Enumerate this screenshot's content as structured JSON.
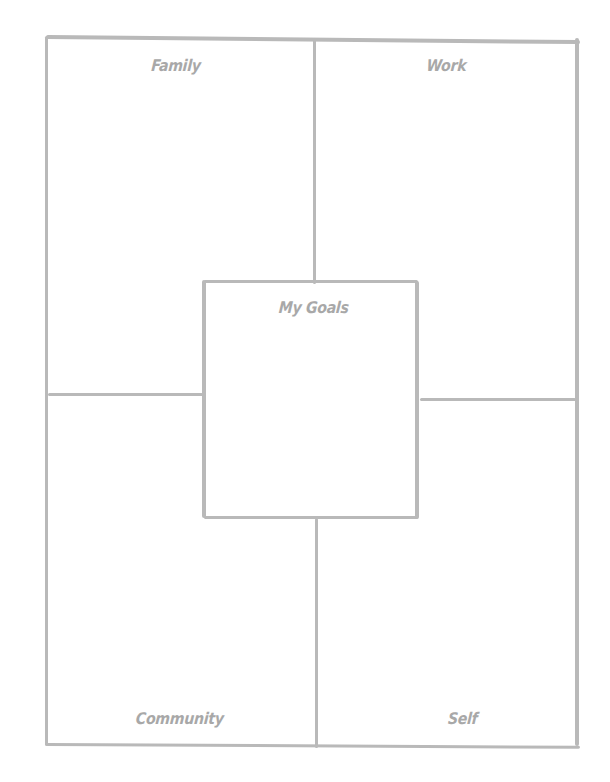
{
  "worksheet": {
    "center": {
      "label": "My Goals"
    },
    "quadrants": [
      {
        "id": "family",
        "label": "Family"
      },
      {
        "id": "work",
        "label": "Work"
      },
      {
        "id": "community",
        "label": "Community"
      },
      {
        "id": "self",
        "label": "Self"
      }
    ]
  },
  "colors": {
    "line": "#b9b9b9",
    "label": "#a8a8a8",
    "background": "#ffffff"
  }
}
